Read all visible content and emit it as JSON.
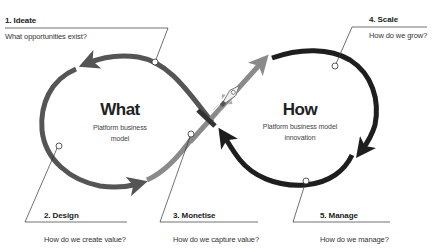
{
  "diagram": {
    "type": "infinity-loop-cycle",
    "colors": {
      "left_loop": "#555555",
      "left_loop_light": "#7a7a7a",
      "right_loop": "#1e1e1e",
      "rocket_trail": "#8a8a8a",
      "leader_line": "#333333",
      "node_fill": "#ffffff"
    },
    "left_center": {
      "title": "What",
      "subtitle_line1": "Platform business",
      "subtitle_line2": "model"
    },
    "right_center": {
      "title": "How",
      "subtitle_line1": "Platform business model",
      "subtitle_line2": "innovation"
    },
    "steps": [
      {
        "title": "1. Ideate",
        "question": "What opportunities exist?"
      },
      {
        "title": "2. Design",
        "question": "How do we create value?"
      },
      {
        "title": "3. Monetise",
        "question": "How do we capture value?"
      },
      {
        "title": "4. Scale",
        "question": "How do we grow?"
      },
      {
        "title": "5. Manage",
        "question": "How do we manage?"
      }
    ],
    "icons": {
      "rocket": "rocket-icon"
    }
  }
}
